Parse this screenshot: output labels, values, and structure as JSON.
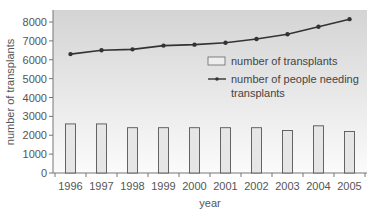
{
  "chart_data": {
    "type": "bar+line",
    "title": "",
    "xlabel": "year",
    "ylabel": "number of transplants",
    "ylim": [
      0,
      8000
    ],
    "yticks": [
      0,
      1000,
      2000,
      3000,
      4000,
      5000,
      6000,
      7000,
      8000
    ],
    "categories": [
      "1996",
      "1997",
      "1998",
      "1999",
      "2000",
      "2001",
      "2002",
      "2003",
      "2004",
      "2005"
    ],
    "series": [
      {
        "name": "number of transplants",
        "type": "bar",
        "values": [
          2600,
          2600,
          2400,
          2400,
          2400,
          2400,
          2400,
          2250,
          2500,
          2200
        ]
      },
      {
        "name": "number of people needing transplants",
        "type": "line",
        "values": [
          6300,
          6500,
          6550,
          6750,
          6800,
          6900,
          7100,
          7350,
          7750,
          8150
        ]
      }
    ],
    "legend": {
      "position": "inside-right",
      "entries": [
        "number of transplants",
        "number of people needing transplants"
      ]
    },
    "grid": false
  },
  "colors": {
    "bar_fill": "#e6e6e6",
    "bar_stroke": "#555555",
    "line": "#333333",
    "plot_bg_top": "#d4d4d4",
    "plot_bg_bottom": "#fbfbfb",
    "axis": "#777777"
  },
  "legend_lines": {
    "bar_label": "number of transplants",
    "line_label_1": "number of people needing",
    "line_label_2": "transplants"
  },
  "axis_titles": {
    "x": "year",
    "y": "number of transplants"
  }
}
